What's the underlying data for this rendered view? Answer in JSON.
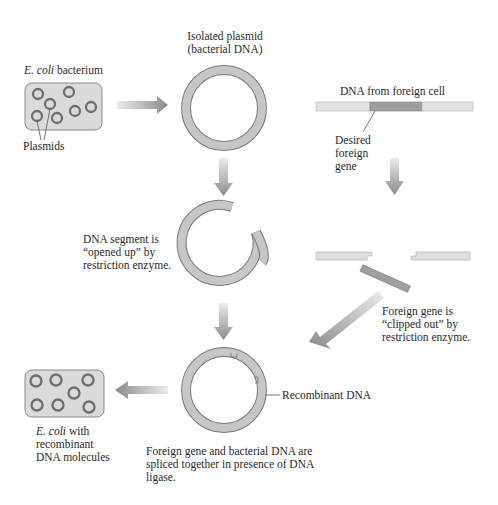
{
  "diagram": {
    "labels": {
      "ecoli_top_italic": "E. coli",
      "ecoli_top_rest": " bacterium",
      "plasmids": "Plasmids",
      "isolated_plasmid_line1": "Isolated plasmid",
      "isolated_plasmid_line2": "(bacterial DNA)",
      "dna_foreign_cell": "DNA from foreign cell",
      "desired_line1": "Desired",
      "desired_line2": "foreign",
      "desired_line3": "gene",
      "opened_line1": "DNA segment is",
      "opened_line2": "“opened up” by",
      "opened_line3": "restriction enzyme.",
      "clipped_line1": "Foreign gene is",
      "clipped_line2": "“clipped out” by",
      "clipped_line3": "restriction enzyme.",
      "recombinant_dna": "Recombinant DNA",
      "ecoli_bottom_italic": "E. coli",
      "ecoli_bottom_rest": " with",
      "ecoli_bottom_line2": "recombinant",
      "ecoli_bottom_line3": "DNA molecules",
      "spliced_line1": "Foreign gene and bacterial DNA are",
      "spliced_line2": "spliced together in presence of DNA",
      "spliced_line3": "ligase."
    },
    "colors": {
      "ring_fill": "#c4c4c4",
      "ring_stroke": "#7a7a7a",
      "cell_fill": "#d9d9d9",
      "cell_stroke": "#8a8a8a",
      "gene_fill": "#9e9e9e",
      "strand_fill": "#dedede",
      "arrow_light": "#e6e6e6",
      "arrow_dark": "#8c8c8c",
      "text": "#2a2a2a"
    }
  }
}
